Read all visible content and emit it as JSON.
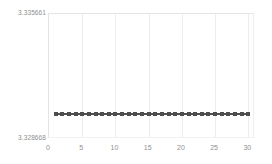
{
  "chart_data": {
    "type": "line",
    "title": "",
    "xlabel": "",
    "ylabel": "",
    "grid": true,
    "legend": false,
    "marker": "square",
    "line_color": "#4d4d4d",
    "marker_color": "#4d4d4d",
    "grid_color": "#ededed",
    "label_color": "#8f8f8f",
    "xlim": [
      0,
      31
    ],
    "ylim": [
      3.328668,
      3.335661
    ],
    "y_tick_labels": [
      "3.335661",
      "3.328668"
    ],
    "y_ticks": [
      3.335661,
      3.328668
    ],
    "x_ticks": [
      0,
      5,
      10,
      15,
      20,
      25,
      30
    ],
    "x_tick_labels": [
      "0",
      "5",
      "10",
      "15",
      "20",
      "25",
      "30"
    ],
    "x": [
      1,
      2,
      3,
      4,
      5,
      6,
      7,
      8,
      9,
      10,
      11,
      12,
      13,
      14,
      15,
      16,
      17,
      18,
      19,
      20,
      21,
      22,
      23,
      24,
      25,
      26,
      27,
      28,
      29,
      30
    ],
    "values": [
      3.330065,
      3.330065,
      3.330065,
      3.330065,
      3.330065,
      3.330065,
      3.330065,
      3.330065,
      3.330065,
      3.330065,
      3.330065,
      3.330065,
      3.330065,
      3.330065,
      3.330065,
      3.330065,
      3.330065,
      3.330065,
      3.330065,
      3.330065,
      3.330065,
      3.330065,
      3.330065,
      3.330065,
      3.330065,
      3.330065,
      3.330065,
      3.330065,
      3.330065,
      3.330065
    ],
    "series": [
      {
        "name": "series-1",
        "values": [
          3.330065,
          3.330065,
          3.330065,
          3.330065,
          3.330065,
          3.330065,
          3.330065,
          3.330065,
          3.330065,
          3.330065,
          3.330065,
          3.330065,
          3.330065,
          3.330065,
          3.330065,
          3.330065,
          3.330065,
          3.330065,
          3.330065,
          3.330065,
          3.330065,
          3.330065,
          3.330065,
          3.330065,
          3.330065,
          3.330065,
          3.330065,
          3.330065,
          3.330065,
          3.330065
        ]
      }
    ]
  }
}
